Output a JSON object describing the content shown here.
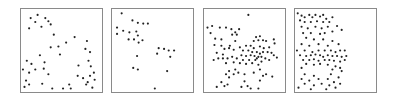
{
  "chart_data": [
    {
      "type": "scatter",
      "title": "",
      "xlabel": "",
      "ylabel": "",
      "grid": false,
      "legend": null,
      "xlim": [
        0,
        1
      ],
      "ylim": [
        0,
        1
      ],
      "note": "Panel 1: sparse, points spread toward corners/edges (y measured from top)",
      "points": [
        [
          0.1,
          0.09
        ],
        [
          0.19,
          0.05
        ],
        [
          0.29,
          0.09
        ],
        [
          0.36,
          0.17
        ],
        [
          0.08,
          0.22
        ],
        [
          0.33,
          0.13
        ],
        [
          0.24,
          0.2
        ],
        [
          0.16,
          0.14
        ],
        [
          0.4,
          0.3
        ],
        [
          0.67,
          0.33
        ],
        [
          0.81,
          0.48
        ],
        [
          0.83,
          0.38
        ],
        [
          0.56,
          0.4
        ],
        [
          0.46,
          0.45
        ],
        [
          0.36,
          0.46
        ],
        [
          0.22,
          0.56
        ],
        [
          0.05,
          0.63
        ],
        [
          0.11,
          0.67
        ],
        [
          0.28,
          0.65
        ],
        [
          0.0,
          0.74
        ],
        [
          0.16,
          0.74
        ],
        [
          0.08,
          0.78
        ],
        [
          0.27,
          0.73
        ],
        [
          0.33,
          0.8
        ],
        [
          0.04,
          0.88
        ],
        [
          0.08,
          0.93
        ],
        [
          0.25,
          0.92
        ],
        [
          0.38,
          0.98
        ],
        [
          0.52,
          0.98
        ],
        [
          0.71,
          0.82
        ],
        [
          0.87,
          0.52
        ],
        [
          0.85,
          0.63
        ],
        [
          0.88,
          0.7
        ],
        [
          0.92,
          0.78
        ],
        [
          0.87,
          0.82
        ],
        [
          0.84,
          0.9
        ],
        [
          0.93,
          0.87
        ],
        [
          0.82,
          0.93
        ],
        [
          0.9,
          0.97
        ],
        [
          0.62,
          0.98
        ],
        [
          0.78,
          0.85
        ],
        [
          0.72,
          0.69
        ],
        [
          0.02,
          0.96
        ],
        [
          0.48,
          0.55
        ],
        [
          0.6,
          0.93
        ]
      ]
    },
    {
      "type": "scatter",
      "title": "",
      "xlabel": "",
      "ylabel": "",
      "grid": false,
      "legend": null,
      "xlim": [
        0,
        1
      ],
      "ylim": [
        0,
        1
      ],
      "note": "Panel 2: fewer points, cluster upper-left, sparse middle-right",
      "points": [
        [
          0.1,
          0.03
        ],
        [
          0.24,
          0.12
        ],
        [
          0.31,
          0.15
        ],
        [
          0.38,
          0.16
        ],
        [
          0.44,
          0.16
        ],
        [
          0.04,
          0.21
        ],
        [
          0.12,
          0.25
        ],
        [
          0.29,
          0.26
        ],
        [
          0.2,
          0.27
        ],
        [
          0.04,
          0.29
        ],
        [
          0.31,
          0.31
        ],
        [
          0.26,
          0.36
        ],
        [
          0.19,
          0.36
        ],
        [
          0.32,
          0.4
        ],
        [
          0.58,
          0.47
        ],
        [
          0.65,
          0.48
        ],
        [
          0.71,
          0.5
        ],
        [
          0.78,
          0.5
        ],
        [
          0.56,
          0.54
        ],
        [
          0.73,
          0.58
        ],
        [
          0.3,
          0.57
        ],
        [
          0.37,
          0.37
        ],
        [
          0.25,
          0.72
        ],
        [
          0.31,
          0.74
        ],
        [
          0.69,
          0.76
        ],
        [
          0.53,
          0.98
        ]
      ]
    },
    {
      "type": "scatter",
      "title": "",
      "xlabel": "",
      "ylabel": "",
      "grid": false,
      "legend": null,
      "xlim": [
        0,
        1
      ],
      "ylim": [
        0,
        1
      ],
      "note": "Panel 3: many points, dense horizontal band around middle, center-right cluster",
      "points": [
        [
          0.55,
          0.05
        ],
        [
          0.02,
          0.21
        ],
        [
          0.08,
          0.19
        ],
        [
          0.18,
          0.21
        ],
        [
          0.26,
          0.21
        ],
        [
          0.33,
          0.23
        ],
        [
          0.43,
          0.23
        ],
        [
          0.38,
          0.27
        ],
        [
          0.06,
          0.28
        ],
        [
          0.34,
          0.3
        ],
        [
          0.4,
          0.3
        ],
        [
          0.12,
          0.35
        ],
        [
          0.2,
          0.36
        ],
        [
          0.38,
          0.38
        ],
        [
          0.31,
          0.44
        ],
        [
          0.65,
          0.33
        ],
        [
          0.7,
          0.32
        ],
        [
          0.68,
          0.37
        ],
        [
          0.74,
          0.37
        ],
        [
          0.78,
          0.38
        ],
        [
          0.62,
          0.38
        ],
        [
          0.88,
          0.36
        ],
        [
          0.89,
          0.41
        ],
        [
          0.2,
          0.44
        ],
        [
          0.11,
          0.43
        ],
        [
          0.24,
          0.48
        ],
        [
          0.3,
          0.47
        ],
        [
          0.14,
          0.53
        ],
        [
          0.22,
          0.55
        ],
        [
          0.36,
          0.49
        ],
        [
          0.44,
          0.46
        ],
        [
          0.52,
          0.44
        ],
        [
          0.58,
          0.44
        ],
        [
          0.62,
          0.47
        ],
        [
          0.7,
          0.45
        ],
        [
          0.75,
          0.47
        ],
        [
          0.82,
          0.46
        ],
        [
          0.48,
          0.5
        ],
        [
          0.55,
          0.5
        ],
        [
          0.6,
          0.52
        ],
        [
          0.66,
          0.52
        ],
        [
          0.7,
          0.54
        ],
        [
          0.74,
          0.52
        ],
        [
          0.8,
          0.52
        ],
        [
          0.85,
          0.53
        ],
        [
          0.88,
          0.56
        ],
        [
          0.92,
          0.59
        ],
        [
          0.46,
          0.56
        ],
        [
          0.52,
          0.57
        ],
        [
          0.58,
          0.56
        ],
        [
          0.63,
          0.57
        ],
        [
          0.68,
          0.58
        ],
        [
          0.72,
          0.58
        ],
        [
          0.77,
          0.6
        ],
        [
          0.82,
          0.62
        ],
        [
          0.4,
          0.6
        ],
        [
          0.34,
          0.58
        ],
        [
          0.28,
          0.6
        ],
        [
          0.22,
          0.6
        ],
        [
          0.16,
          0.6
        ],
        [
          0.1,
          0.62
        ],
        [
          0.48,
          0.62
        ],
        [
          0.56,
          0.62
        ],
        [
          0.64,
          0.62
        ],
        [
          0.44,
          0.66
        ],
        [
          0.52,
          0.67
        ],
        [
          0.6,
          0.66
        ],
        [
          0.68,
          0.68
        ],
        [
          0.26,
          0.66
        ],
        [
          0.36,
          0.65
        ],
        [
          0.72,
          0.64
        ],
        [
          0.66,
          0.6
        ],
        [
          0.38,
          0.74
        ],
        [
          0.3,
          0.76
        ],
        [
          0.26,
          0.8
        ],
        [
          0.36,
          0.8
        ],
        [
          0.42,
          0.78
        ],
        [
          0.3,
          0.84
        ],
        [
          0.5,
          0.8
        ],
        [
          0.62,
          0.78
        ],
        [
          0.7,
          0.74
        ],
        [
          0.74,
          0.82
        ],
        [
          0.78,
          0.8
        ],
        [
          0.86,
          0.83
        ],
        [
          0.7,
          0.88
        ],
        [
          0.28,
          0.93
        ],
        [
          0.2,
          0.9
        ],
        [
          0.46,
          0.96
        ],
        [
          0.54,
          0.95
        ],
        [
          0.58,
          0.98
        ],
        [
          0.68,
          0.98
        ],
        [
          0.5,
          0.89
        ],
        [
          0.14,
          0.96
        ],
        [
          0.24,
          0.95
        ]
      ]
    },
    {
      "type": "scatter",
      "title": "",
      "xlabel": "",
      "ylabel": "",
      "grid": false,
      "legend": null,
      "xlim": [
        0,
        1
      ],
      "ylim": [
        0,
        1
      ],
      "note": "Panel 4: points confined to left ~half, dense band near middle",
      "points": [
        [
          0.01,
          0.03
        ],
        [
          0.06,
          0.06
        ],
        [
          0.1,
          0.08
        ],
        [
          0.16,
          0.05
        ],
        [
          0.2,
          0.08
        ],
        [
          0.24,
          0.05
        ],
        [
          0.3,
          0.07
        ],
        [
          0.34,
          0.05
        ],
        [
          0.38,
          0.1
        ],
        [
          0.46,
          0.08
        ],
        [
          0.04,
          0.12
        ],
        [
          0.1,
          0.14
        ],
        [
          0.18,
          0.14
        ],
        [
          0.26,
          0.13
        ],
        [
          0.34,
          0.14
        ],
        [
          0.42,
          0.14
        ],
        [
          0.06,
          0.2
        ],
        [
          0.14,
          0.22
        ],
        [
          0.24,
          0.2
        ],
        [
          0.32,
          0.22
        ],
        [
          0.4,
          0.2
        ],
        [
          0.52,
          0.19
        ],
        [
          0.08,
          0.28
        ],
        [
          0.18,
          0.28
        ],
        [
          0.3,
          0.29
        ],
        [
          0.36,
          0.28
        ],
        [
          0.46,
          0.26
        ],
        [
          0.58,
          0.24
        ],
        [
          0.12,
          0.34
        ],
        [
          0.22,
          0.36
        ],
        [
          0.34,
          0.36
        ],
        [
          0.46,
          0.38
        ],
        [
          0.06,
          0.42
        ],
        [
          0.16,
          0.44
        ],
        [
          0.28,
          0.42
        ],
        [
          0.4,
          0.44
        ],
        [
          0.54,
          0.42
        ],
        [
          0.0,
          0.5
        ],
        [
          0.1,
          0.5
        ],
        [
          0.2,
          0.52
        ],
        [
          0.28,
          0.5
        ],
        [
          0.36,
          0.5
        ],
        [
          0.44,
          0.5
        ],
        [
          0.5,
          0.52
        ],
        [
          0.56,
          0.5
        ],
        [
          0.62,
          0.5
        ],
        [
          0.04,
          0.56
        ],
        [
          0.12,
          0.57
        ],
        [
          0.18,
          0.56
        ],
        [
          0.24,
          0.55
        ],
        [
          0.3,
          0.56
        ],
        [
          0.34,
          0.58
        ],
        [
          0.4,
          0.56
        ],
        [
          0.46,
          0.57
        ],
        [
          0.52,
          0.57
        ],
        [
          0.58,
          0.58
        ],
        [
          0.64,
          0.57
        ],
        [
          0.08,
          0.62
        ],
        [
          0.16,
          0.62
        ],
        [
          0.22,
          0.61
        ],
        [
          0.28,
          0.63
        ],
        [
          0.36,
          0.62
        ],
        [
          0.42,
          0.62
        ],
        [
          0.48,
          0.63
        ],
        [
          0.56,
          0.64
        ],
        [
          0.62,
          0.62
        ],
        [
          0.12,
          0.67
        ],
        [
          0.22,
          0.68
        ],
        [
          0.3,
          0.67
        ],
        [
          0.4,
          0.68
        ],
        [
          0.5,
          0.7
        ],
        [
          0.56,
          0.72
        ],
        [
          0.06,
          0.72
        ],
        [
          0.46,
          0.74
        ],
        [
          0.58,
          0.76
        ],
        [
          0.1,
          0.8
        ],
        [
          0.22,
          0.82
        ],
        [
          0.44,
          0.8
        ],
        [
          0.54,
          0.84
        ],
        [
          0.06,
          0.86
        ],
        [
          0.16,
          0.88
        ],
        [
          0.28,
          0.86
        ],
        [
          0.4,
          0.86
        ],
        [
          0.48,
          0.9
        ],
        [
          0.1,
          0.92
        ],
        [
          0.22,
          0.94
        ],
        [
          0.32,
          0.92
        ],
        [
          0.42,
          0.94
        ],
        [
          0.56,
          0.92
        ],
        [
          0.02,
          0.97
        ],
        [
          0.18,
          0.99
        ],
        [
          0.38,
          0.99
        ],
        [
          0.5,
          0.97
        ]
      ]
    }
  ],
  "panels": [
    {
      "id": "panel-1",
      "left": 20
    },
    {
      "id": "panel-2",
      "left": 111
    },
    {
      "id": "panel-3",
      "left": 203
    },
    {
      "id": "panel-4",
      "left": 294
    }
  ],
  "style": {
    "border_color": "#8a8a8a",
    "dot_color": "#222222",
    "background": "#ffffff",
    "dot_radius": 1.1
  }
}
